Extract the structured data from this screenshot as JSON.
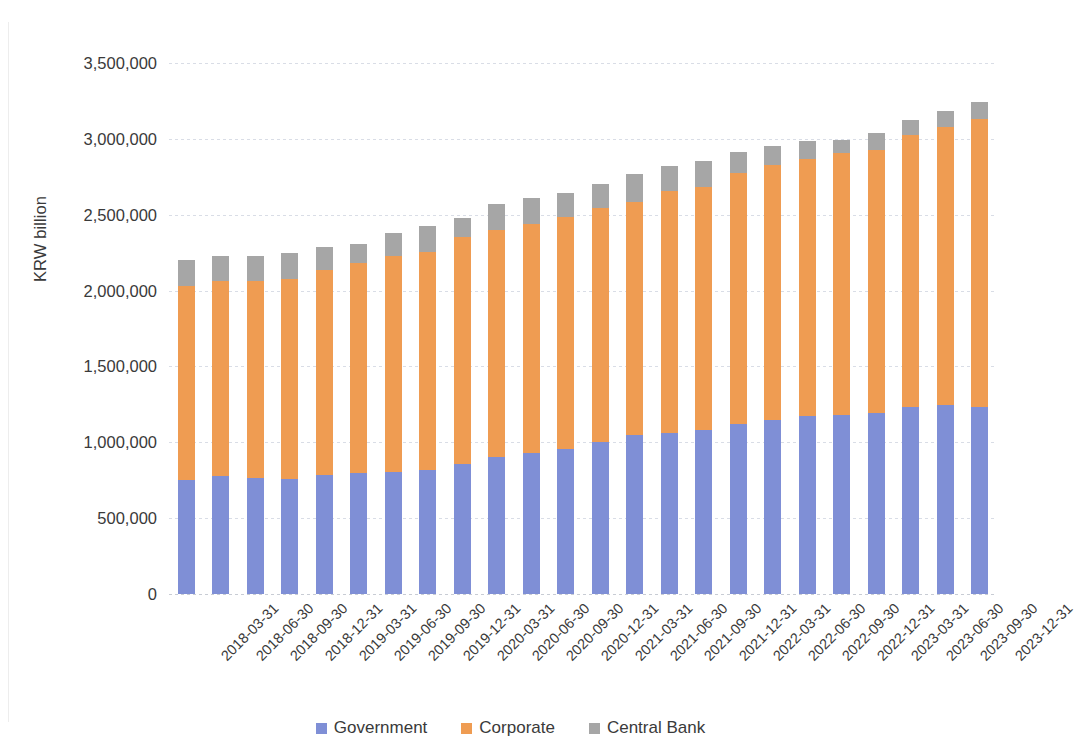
{
  "chart_data": {
    "type": "bar",
    "subtype": "stacked-column",
    "title": "",
    "xlabel": "",
    "ylabel": "KRW billion",
    "ylim": [
      0,
      3500000
    ],
    "yticks": [
      0,
      500000,
      1000000,
      1500000,
      2000000,
      2500000,
      3000000,
      3500000
    ],
    "ytick_labels": [
      "0",
      "500,000",
      "1,000,000",
      "1,500,000",
      "2,000,000",
      "2,500,000",
      "3,000,000",
      "3,500,000"
    ],
    "grid": true,
    "legend_position": "bottom",
    "categories": [
      "2018-03-31",
      "2018-06-30",
      "2018-09-30",
      "2018-12-31",
      "2019-03-31",
      "2019-06-30",
      "2019-09-30",
      "2019-12-31",
      "2020-03-31",
      "2020-06-30",
      "2020-09-30",
      "2020-12-31",
      "2021-03-31",
      "2021-06-30",
      "2021-09-30",
      "2021-12-31",
      "2022-03-31",
      "2022-06-30",
      "2022-09-30",
      "2022-12-31",
      "2023-03-31",
      "2023-06-30",
      "2023-09-30",
      "2023-12-31"
    ],
    "series": [
      {
        "name": "Government",
        "color": "#7f8fd6",
        "values": [
          752000,
          775000,
          765000,
          755000,
          785000,
          800000,
          805000,
          815000,
          860000,
          900000,
          930000,
          955000,
          1000000,
          1045000,
          1060000,
          1080000,
          1120000,
          1150000,
          1175000,
          1180000,
          1195000,
          1235000,
          1245000,
          1230000
        ]
      },
      {
        "name": "Corporate",
        "color": "#ef9c52",
        "values": [
          1280000,
          1290000,
          1295000,
          1320000,
          1350000,
          1385000,
          1420000,
          1440000,
          1490000,
          1500000,
          1510000,
          1530000,
          1545000,
          1540000,
          1595000,
          1605000,
          1655000,
          1675000,
          1690000,
          1730000,
          1730000,
          1790000,
          1835000,
          1900000
        ]
      },
      {
        "name": "Central Bank",
        "color": "#a6a6a6",
        "values": [
          170000,
          165000,
          165000,
          170000,
          150000,
          125000,
          155000,
          170000,
          130000,
          170000,
          170000,
          155000,
          155000,
          185000,
          165000,
          170000,
          140000,
          130000,
          120000,
          85000,
          115000,
          100000,
          105000,
          110000
        ]
      }
    ],
    "totals": [
      2202000,
      2230000,
      2225000,
      2245000,
      2285000,
      2310000,
      2380000,
      2425000,
      2480000,
      2570000,
      2610000,
      2640000,
      2700000,
      2770000,
      2820000,
      2855000,
      2915000,
      2955000,
      2985000,
      2995000,
      3040000,
      3125000,
      3185000,
      3240000
    ]
  },
  "axis": {
    "y_title": "KRW billion"
  },
  "legend": {
    "items": [
      {
        "label": "Government",
        "color": "#7f8fd6"
      },
      {
        "label": "Corporate",
        "color": "#ef9c52"
      },
      {
        "label": "Central Bank",
        "color": "#a6a6a6"
      }
    ]
  }
}
